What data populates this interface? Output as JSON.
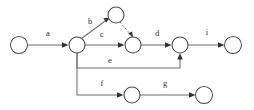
{
  "diagram": {
    "type": "activity-network-graph",
    "title": "",
    "canvas": {
      "width": 254,
      "height": 110
    },
    "colors": {
      "background": "#ffffff",
      "node_stroke": "#4a4a4a",
      "node_fill": "#ffffff",
      "edge_stroke": "#6e6e6e",
      "arrow_fill": "#333333",
      "label_color": "#2b2b2b"
    },
    "nodes": [
      {
        "id": "n1",
        "label": "",
        "cx": 19,
        "cy": 45,
        "r": 8.5
      },
      {
        "id": "n2",
        "label": "",
        "cx": 77,
        "cy": 45,
        "r": 8.0
      },
      {
        "id": "n3",
        "label": "",
        "cx": 116,
        "cy": 15,
        "r": 8.0
      },
      {
        "id": "n4",
        "label": "",
        "cx": 133,
        "cy": 45,
        "r": 8.0
      },
      {
        "id": "n5",
        "label": "",
        "cx": 180,
        "cy": 45,
        "r": 8.0
      },
      {
        "id": "n6",
        "label": "",
        "cx": 233,
        "cy": 45,
        "r": 8.5
      },
      {
        "id": "n7",
        "label": "",
        "cx": 132,
        "cy": 95,
        "r": 8.0
      },
      {
        "id": "n8",
        "label": "",
        "cx": 204,
        "cy": 95,
        "r": 8.5
      }
    ],
    "edges": [
      {
        "id": "e_a",
        "label": "a",
        "from": "n1",
        "to": "n2",
        "style": "solid",
        "label_x": 48,
        "label_y": 36
      },
      {
        "id": "e_b",
        "label": "b",
        "from": "n2",
        "to": "n3",
        "style": "solid",
        "label_x": 90,
        "label_y": 24
      },
      {
        "id": "e_dashed",
        "label": "",
        "from": "n3",
        "to": "n4",
        "style": "dashed",
        "label_x": 0,
        "label_y": 0
      },
      {
        "id": "e_c",
        "label": "c",
        "from": "n2",
        "to": "n4",
        "style": "solid",
        "label_x": 102,
        "label_y": 37
      },
      {
        "id": "e_d",
        "label": "d",
        "from": "n4",
        "to": "n5",
        "style": "solid",
        "label_x": 157,
        "label_y": 36
      },
      {
        "id": "e_i",
        "label": "i",
        "from": "n5",
        "to": "n6",
        "style": "solid",
        "label_x": 207,
        "label_y": 35
      },
      {
        "id": "e_e",
        "label": "e",
        "from": "n2",
        "to": "n5",
        "style": "solid-orthogonal",
        "label_x": 110,
        "label_y": 63
      },
      {
        "id": "e_f",
        "label": "f",
        "from": "n2",
        "to": "n7",
        "style": "solid-orthogonal",
        "label_x": 102,
        "label_y": 86
      },
      {
        "id": "e_g",
        "label": "g",
        "from": "n7",
        "to": "n8",
        "style": "solid",
        "label_x": 165,
        "label_y": 86
      }
    ],
    "edge_labels": [
      "a",
      "b",
      "c",
      "d",
      "e",
      "f",
      "g",
      "i"
    ]
  }
}
